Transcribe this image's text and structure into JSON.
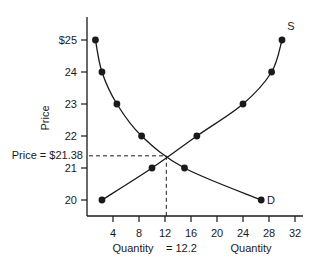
{
  "chart_data": {
    "type": "line",
    "title": "",
    "xlabel": "Quantity",
    "ylabel": "Price",
    "xlim": [
      0,
      33
    ],
    "ylim": [
      20,
      25.7
    ],
    "x_ticks": [
      4,
      8,
      12,
      16,
      20,
      24,
      28,
      32
    ],
    "x_tick_labels": [
      "4",
      "8",
      "12",
      "16",
      "20",
      "24",
      "28",
      "32"
    ],
    "y_ticks": [
      20,
      21,
      22,
      23,
      24,
      25
    ],
    "y_tick_labels": [
      "20",
      "21",
      "22",
      "23",
      "24",
      "$25"
    ],
    "grid": false,
    "legend": "none (curves labeled inline)",
    "series": [
      {
        "name": "D",
        "label": "D",
        "points": [
          {
            "x": 1.3,
            "y": 25
          },
          {
            "x": 2.3,
            "y": 24
          },
          {
            "x": 4.6,
            "y": 23
          },
          {
            "x": 8.4,
            "y": 22
          },
          {
            "x": 15.0,
            "y": 21
          },
          {
            "x": 26.8,
            "y": 20
          }
        ]
      },
      {
        "name": "S",
        "label": "S",
        "points": [
          {
            "x": 2.3,
            "y": 20
          },
          {
            "x": 10.0,
            "y": 21
          },
          {
            "x": 16.9,
            "y": 22
          },
          {
            "x": 24.0,
            "y": 23
          },
          {
            "x": 28.4,
            "y": 24
          },
          {
            "x": 30.0,
            "y": 25
          }
        ]
      }
    ],
    "equilibrium": {
      "quantity": 12.2,
      "price": 21.38
    },
    "annotations": [
      {
        "text": "Price = $21.38",
        "at": "y=21.38",
        "style": "dashed horizontal guide"
      },
      {
        "text": "Quantity = 12.2",
        "at": "x=12.2",
        "style": "dashed vertical guide"
      }
    ]
  },
  "labels": {
    "y_axis_title": "Price",
    "x_axis_title": "Quantity",
    "eq_price_label": "Price = $21.38",
    "eq_quantity_prefix": "Quantity",
    "eq_quantity_value": "= 12.2",
    "supply_label": "S",
    "demand_label": "D"
  }
}
